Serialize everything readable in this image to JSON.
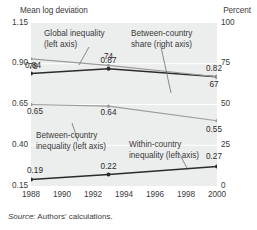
{
  "captions": {
    "left_axis_title": "Mean log deviation",
    "right_axis_title": "Percent"
  },
  "source": {
    "label": "Source:",
    "text": "Authors' calculations."
  },
  "annotations": [
    {
      "name": "global-inequality",
      "line1": "Global inequality",
      "line2": "(left axis)"
    },
    {
      "name": "between-country-share",
      "line1": "Between-country",
      "line2": "share (right axis)"
    },
    {
      "name": "between-country-inequality",
      "line1": "Between-country",
      "line2": "inequality (left axis)"
    },
    {
      "name": "within-country-inequality",
      "line1": "Within-country",
      "line2": "inequality (left axis)"
    }
  ],
  "chart_data": {
    "type": "line",
    "title": "",
    "xlabel": "",
    "ylabel": "Mean log deviation",
    "y2label": "Percent",
    "grid": true,
    "legend": "annotations-inline",
    "x": [
      1988,
      1990,
      1992,
      1994,
      1996,
      1998,
      2000
    ],
    "xlim": [
      1988,
      2000
    ],
    "xticks": [
      "1988",
      "1990",
      "1992",
      "1994",
      "1996",
      "1998",
      "2000"
    ],
    "ylim": [
      0.15,
      1.15
    ],
    "yticks": [
      "1.15",
      "0.90",
      "0.65",
      "0.40",
      "0.15"
    ],
    "ytick_values": [
      1.15,
      0.9,
      0.65,
      0.4,
      0.15
    ],
    "y2lim": [
      0,
      100
    ],
    "y2ticks": [
      "100",
      "75",
      "50",
      "25",
      "0"
    ],
    "y2tick_values": [
      100,
      75,
      50,
      25,
      0
    ],
    "series": [
      {
        "name": "Global inequality (left axis)",
        "axis": "left",
        "color": "#2b2b2b",
        "points": [
          {
            "x": 1988,
            "y": 0.84,
            "label": "0.84"
          },
          {
            "x": 1993,
            "y": 0.87,
            "label": "0.87"
          },
          {
            "x": 2000,
            "y": 0.82,
            "label": "0.82"
          }
        ]
      },
      {
        "name": "Between-country share (right axis)",
        "axis": "right",
        "color": "#9b9b9b",
        "points": [
          {
            "x": 1988,
            "y": 78,
            "label": "78"
          },
          {
            "x": 1993,
            "y": 74,
            "label": "74"
          },
          {
            "x": 2000,
            "y": 67,
            "label": "67"
          }
        ]
      },
      {
        "name": "Between-country inequality (left axis)",
        "axis": "left",
        "color": "#9b9b9b",
        "points": [
          {
            "x": 1988,
            "y": 0.65,
            "label": "0.65"
          },
          {
            "x": 1993,
            "y": 0.64,
            "label": "0.64"
          },
          {
            "x": 2000,
            "y": 0.55,
            "label": "0.55"
          }
        ]
      },
      {
        "name": "Within-country inequality (left axis)",
        "axis": "left",
        "color": "#2b2b2b",
        "points": [
          {
            "x": 1988,
            "y": 0.19,
            "label": "0.19"
          },
          {
            "x": 1993,
            "y": 0.22,
            "label": "0.22"
          },
          {
            "x": 2000,
            "y": 0.27,
            "label": "0.27"
          }
        ]
      }
    ]
  }
}
